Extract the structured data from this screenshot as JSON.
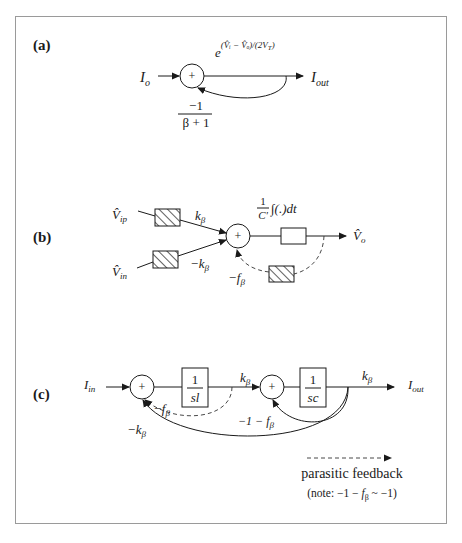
{
  "figure": {
    "panels": {
      "a": {
        "label": "(a)",
        "input": "I",
        "input_sub": "o",
        "sum_sign": "+",
        "forward_gain": "e",
        "forward_gain_exponent": "(V̂ᵢ − V̂ₒ)/(2V",
        "forward_gain_exponent_sub": "T",
        "forward_gain_exponent_close": ")",
        "output": "I",
        "output_sub": "out",
        "feedback_gain_numerator": "−1",
        "feedback_gain_denominator": "β + 1"
      },
      "b": {
        "label": "(b)",
        "input_pos": "V̂",
        "input_pos_sub": "ip",
        "input_neg": "V̂",
        "input_neg_sub": "in",
        "gain_pos": "k",
        "gain_pos_sub": "β",
        "gain_neg": "−k",
        "gain_neg_sub": "β",
        "sum_sign": "+",
        "integrator_num": "1",
        "integrator_den": "C'",
        "integrator_expr": "∫(.)dt",
        "output": "V̂",
        "output_sub": "o",
        "parasitic_gain": "−f",
        "parasitic_gain_sub": "β"
      },
      "c": {
        "label": "(c)",
        "input": "I",
        "input_sub": "in",
        "sum1_sign": "+",
        "block1_num": "1",
        "block1_den": "sl",
        "gain1": "k",
        "gain1_sub": "β",
        "sum2_sign": "+",
        "block2_num": "1",
        "block2_den": "sc",
        "gain2": "k",
        "gain2_sub": "β",
        "output": "I",
        "output_sub": "out",
        "parasitic_gain": "−f",
        "parasitic_gain_sub": "β",
        "inner_feedback_gain": "−1 − f",
        "inner_feedback_gain_sub": "β",
        "outer_feedback_gain": "−k",
        "outer_feedback_gain_sub": "β"
      }
    },
    "legend": {
      "dashed_label": "parasitic feedback",
      "note_prefix": "(note: −1 − ",
      "note_f": "f",
      "note_sub": "β",
      "note_suffix": " ~ −1)"
    }
  }
}
